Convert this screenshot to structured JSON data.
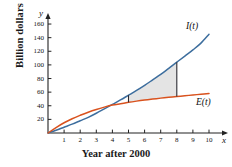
{
  "chart_data": {
    "type": "line",
    "title": "",
    "xlabel": "Year after 2000",
    "ylabel": "Billion dollars",
    "xlim": [
      0,
      10
    ],
    "ylim": [
      0,
      170
    ],
    "grid": false,
    "legend_position": "inline-at-curve-end",
    "x_ticks": [
      "1",
      "2",
      "3",
      "4",
      "5",
      "6",
      "7",
      "8",
      "9",
      "10"
    ],
    "x_tick_values": [
      1,
      2,
      3,
      4,
      5,
      6,
      7,
      8,
      9,
      10
    ],
    "y_ticks": [
      "20",
      "40",
      "60",
      "80",
      "100",
      "120",
      "140",
      "160"
    ],
    "y_tick_values": [
      20,
      40,
      60,
      80,
      100,
      120,
      140,
      160
    ],
    "x_axis_name": "x",
    "y_axis_name": "y",
    "series": [
      {
        "name": "I(t)",
        "label": "I(t)",
        "color": "#3d6e9e",
        "x": [
          0,
          0.5,
          1,
          1.5,
          2,
          2.5,
          3,
          3.5,
          4,
          4.5,
          5,
          5.5,
          6,
          6.5,
          7,
          7.5,
          8,
          8.5,
          9,
          9.5,
          10
        ],
        "values": [
          0,
          4,
          8.5,
          13,
          18,
          23,
          29,
          35.5,
          42,
          48.5,
          55.5,
          62.5,
          70,
          78,
          86,
          95,
          104,
          113,
          122,
          132,
          145
        ]
      },
      {
        "name": "E(t)",
        "label": "E(t)",
        "color": "#d9521e",
        "x": [
          0,
          0.5,
          1,
          1.5,
          2,
          2.5,
          3,
          3.5,
          4,
          4.5,
          5,
          5.5,
          6,
          6.5,
          7,
          7.5,
          8,
          8.5,
          9,
          9.5,
          10
        ],
        "values": [
          0,
          8,
          15,
          21,
          26,
          30.5,
          34.5,
          38,
          41,
          43,
          45,
          46.8,
          48.4,
          49.8,
          51.2,
          52.4,
          53.6,
          54.7,
          55.8,
          56.9,
          58
        ]
      }
    ],
    "shaded_region": {
      "label": "area between I(t) and E(t)",
      "x_start": 5,
      "x_end": 8,
      "upper_series": "I(t)",
      "lower_series": "E(t)",
      "fill_color": "#d3d3d3"
    }
  }
}
